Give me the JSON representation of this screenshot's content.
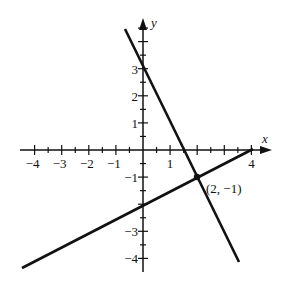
{
  "figure": {
    "x_axis_label": "x",
    "y_axis_label": "y",
    "x_tick_labels": [
      {
        "value": -4,
        "label": "−4"
      },
      {
        "value": -3,
        "label": "−3"
      },
      {
        "value": -2,
        "label": "−2"
      },
      {
        "value": -1,
        "label": "−1"
      },
      {
        "value": 1,
        "label": "1"
      },
      {
        "value": 4,
        "label": "4"
      }
    ],
    "y_tick_labels": [
      {
        "value": 3,
        "label": "3"
      },
      {
        "value": 2,
        "label": "2"
      },
      {
        "value": 1,
        "label": "1"
      },
      {
        "value": -1,
        "label": "−1"
      },
      {
        "value": -3,
        "label": "−3"
      },
      {
        "value": -4,
        "label": "−4"
      }
    ],
    "point_label": "(2, −1)",
    "line_color": "#111111"
  },
  "chart_data": {
    "type": "line",
    "title": "",
    "xlabel": "x",
    "ylabel": "y",
    "xlim": [
      -4.2,
      4.4
    ],
    "ylim": [
      -4.5,
      4.6
    ],
    "grid": false,
    "series": [
      {
        "name": "line 1 (y = -2x + 3)",
        "x": [
          -0.65,
          2,
          2.7
        ],
        "y": [
          4.3,
          -1,
          -4.1
        ]
      },
      {
        "name": "line 2 (y = 0.5x - 2)",
        "x": [
          -4.5,
          0,
          2,
          4.2
        ],
        "y": [
          -4.25,
          -2,
          -1,
          0.1
        ]
      }
    ],
    "points": [
      {
        "x": 2,
        "y": -1,
        "label": "(2, −1)"
      }
    ],
    "annotations": [
      "(2, −1)"
    ]
  }
}
